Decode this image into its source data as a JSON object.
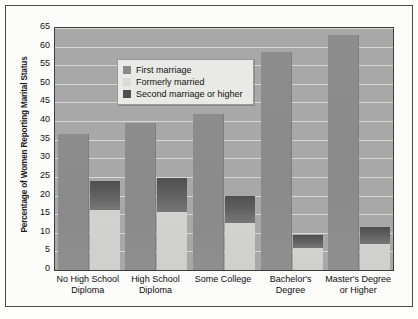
{
  "chart_data": {
    "type": "bar",
    "title": "",
    "xlabel": "",
    "ylabel": "Percentage of Women Reporting Marital Status",
    "ylim": [
      0,
      65
    ],
    "ytick_step": 5,
    "yticks": [
      65,
      60,
      55,
      50,
      45,
      40,
      35,
      30,
      25,
      20,
      15,
      10,
      5,
      0
    ],
    "grid": true,
    "legend_position": "top-left inside plot",
    "categories": [
      "No High School Diploma",
      "High School Diploma",
      "Some College",
      "Bachelor's Degree",
      "Master's Degree or Higher"
    ],
    "category_lines": [
      [
        "No High School",
        "Diploma"
      ],
      [
        "High School",
        "Diploma"
      ],
      [
        "Some College",
        ""
      ],
      [
        "Bachelor's",
        "Degree"
      ],
      [
        "Master's Degree",
        "or Higher"
      ]
    ],
    "series": [
      {
        "name": "First marriage",
        "color": "#8a8a8a",
        "values": [
          36.5,
          39.5,
          42,
          58.5,
          63
        ]
      },
      {
        "name": "Formerly married",
        "color": "#d0d0cc",
        "values": [
          16,
          15.5,
          12.5,
          6,
          7
        ]
      },
      {
        "name": "Second marriage or higher",
        "color": "#5e5e5e",
        "values": [
          24,
          24.8,
          20,
          9.5,
          11.5
        ]
      }
    ],
    "note": "Within each category the right column stacks 'Formerly married' at the base with 'Second marriage or higher' above it, reaching the stated total."
  },
  "legend": {
    "items": [
      {
        "label": "First marriage",
        "swatch": "#8a8a8a"
      },
      {
        "label": "Formerly married",
        "swatch": "#d9d9d5"
      },
      {
        "label": "Second marriage or higher",
        "swatch": "#4f4f4f"
      }
    ]
  },
  "colors": {
    "plot_background": "#a8a8a8",
    "gridline": "#d8d8d4",
    "frame": "#3d3d3d",
    "page_background": "#fdfdfc",
    "text": "#101010"
  }
}
